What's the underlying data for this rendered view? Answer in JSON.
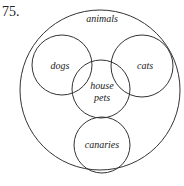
{
  "problem_number": "75.",
  "diagram": {
    "type": "venn",
    "sets": [
      {
        "label": "animals",
        "role": "universal"
      },
      {
        "label": "dogs"
      },
      {
        "label": "cats"
      },
      {
        "label": "house",
        "label_line2": "pets"
      },
      {
        "label": "canaries"
      }
    ]
  }
}
